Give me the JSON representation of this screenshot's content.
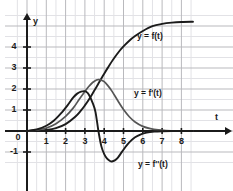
{
  "chart_data": {
    "type": "line",
    "title": "",
    "xlabel": "t",
    "ylabel": "y",
    "xlim": [
      -0.55,
      8.9
    ],
    "ylim": [
      -1.75,
      5.6
    ],
    "grid": true,
    "grid_major_step": 1,
    "grid_minor_step": 0.5,
    "legend": "inline-annotations",
    "xticks": [
      1,
      2,
      3,
      4,
      5,
      6,
      7,
      8
    ],
    "xtick_labels": [
      "1",
      "2",
      "3",
      "4",
      "5",
      "6",
      "7",
      "8"
    ],
    "yticks": [
      -1,
      1,
      2,
      3,
      4
    ],
    "ytick_labels": [
      "-1",
      "1",
      "2",
      "3",
      "4"
    ],
    "origin_label": "0",
    "series": [
      {
        "name": "y = f(t)",
        "color": "#1b1b1b",
        "annotation": "y = f(t)",
        "asymptote": 5.2,
        "x": [
          0,
          0.5,
          1,
          1.5,
          2,
          2.5,
          2.8,
          3,
          3.2,
          3.4,
          3.6,
          3.7,
          3.8,
          4,
          4.2,
          4.5,
          4.8,
          5,
          5.3,
          5.6,
          6,
          6.5,
          7,
          7.5,
          8,
          8.6
        ],
        "values": [
          0.0,
          0.01,
          0.05,
          0.14,
          0.33,
          0.68,
          0.98,
          1.22,
          1.49,
          1.79,
          2.1,
          2.26,
          2.42,
          2.73,
          3.03,
          3.45,
          3.82,
          4.03,
          4.3,
          4.52,
          4.76,
          4.99,
          5.1,
          5.16,
          5.19,
          5.2
        ]
      },
      {
        "name": "y = f'(t)",
        "color": "#555555",
        "annotation": "y = f'(t)",
        "peak_x": 3.7,
        "peak_y": 2.45,
        "x": [
          0,
          0.5,
          1,
          1.5,
          2,
          2.4,
          2.7,
          3,
          3.2,
          3.4,
          3.6,
          3.7,
          3.8,
          4,
          4.2,
          4.4,
          4.7,
          5,
          5.3,
          5.6,
          6,
          6.4,
          6.8,
          7.2,
          7.6,
          8,
          8.6
        ],
        "values": [
          0.0,
          0.04,
          0.14,
          0.35,
          0.7,
          1.1,
          1.5,
          1.88,
          2.12,
          2.31,
          2.43,
          2.45,
          2.44,
          2.35,
          2.15,
          1.9,
          1.45,
          1.02,
          0.68,
          0.43,
          0.22,
          0.11,
          0.05,
          0.02,
          0.01,
          0.0,
          0.0
        ]
      },
      {
        "name": "y = f''(t)",
        "color": "#1b1b1b",
        "annotation": "y = f''(t)",
        "peak_x": 3.0,
        "peak_y": 1.9,
        "zero_x": 3.7,
        "min_x": 4.4,
        "min_y": -1.45,
        "x": [
          0,
          0.5,
          1,
          1.4,
          1.8,
          2.1,
          2.4,
          2.6,
          2.8,
          2.95,
          3.05,
          3.2,
          3.4,
          3.55,
          3.7,
          3.85,
          4,
          4.15,
          4.3,
          4.4,
          4.55,
          4.7,
          4.9,
          5.1,
          5.3,
          5.6,
          5.9,
          6.2,
          6.6,
          7,
          7.5,
          8,
          8.6
        ],
        "values": [
          0.0,
          0.07,
          0.25,
          0.5,
          0.88,
          1.22,
          1.6,
          1.78,
          1.88,
          1.9,
          1.88,
          1.74,
          1.34,
          0.9,
          0.0,
          -0.72,
          -1.1,
          -1.32,
          -1.43,
          -1.45,
          -1.4,
          -1.28,
          -1.02,
          -0.76,
          -0.54,
          -0.3,
          -0.16,
          -0.08,
          -0.03,
          -0.01,
          0.0,
          0.0,
          0.0
        ]
      }
    ]
  },
  "style": {
    "axis_color": "#1b1b1b",
    "grid_major_color": "#b9b9bd",
    "grid_minor_color": "#e2e2e6",
    "background": "#ffffff"
  }
}
